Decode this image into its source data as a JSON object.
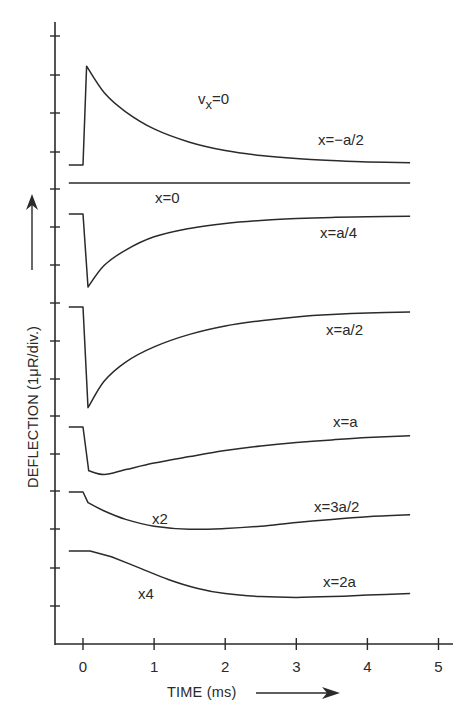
{
  "chart_data": {
    "type": "line",
    "title": "",
    "xlabel": "TIME (ms)",
    "ylabel": "DEFLECTION (1μR/div.)",
    "ylabel_unit_note": "1μR/div.",
    "xlim": [
      -0.4,
      5.3
    ],
    "xticks": [
      0,
      1,
      2,
      3,
      4,
      5
    ],
    "xtick_labels": [
      "0",
      "1",
      "2",
      "3",
      "4",
      "5"
    ],
    "y_tick_count": 16,
    "grid": false,
    "legend": "none (curves labeled inline)",
    "annotation": "v_x=0",
    "series": [
      {
        "name": "x=-a/2",
        "label": "x=−a/2",
        "scale_note": "",
        "baseline_div": 0,
        "points_ms_div": [
          [
            -0.2,
            0
          ],
          [
            0,
            0
          ],
          [
            0.05,
            2.6
          ],
          [
            0.3,
            1.9
          ],
          [
            0.6,
            1.4
          ],
          [
            1,
            0.95
          ],
          [
            1.5,
            0.6
          ],
          [
            2,
            0.38
          ],
          [
            2.5,
            0.25
          ],
          [
            3,
            0.17
          ],
          [
            3.5,
            0.12
          ],
          [
            4,
            0.08
          ],
          [
            4.6,
            0.06
          ]
        ]
      },
      {
        "name": "x=0",
        "label": "x=0",
        "scale_note": "",
        "baseline_div": 0,
        "points_ms_div": [
          [
            -0.2,
            0
          ],
          [
            4.6,
            0
          ]
        ]
      },
      {
        "name": "x=a/4",
        "label": "x=a/4",
        "scale_note": "",
        "baseline_div": 0,
        "points_ms_div": [
          [
            -0.2,
            0
          ],
          [
            0,
            0
          ],
          [
            0.07,
            -1.92
          ],
          [
            0.3,
            -1.35
          ],
          [
            0.6,
            -0.95
          ],
          [
            1,
            -0.6
          ],
          [
            1.5,
            -0.38
          ],
          [
            2,
            -0.25
          ],
          [
            2.5,
            -0.17
          ],
          [
            3,
            -0.12
          ],
          [
            3.5,
            -0.09
          ],
          [
            4,
            -0.07
          ],
          [
            4.6,
            -0.06
          ]
        ]
      },
      {
        "name": "x=a/2",
        "label": "x=a/2",
        "scale_note": "",
        "baseline_div": 0,
        "points_ms_div": [
          [
            -0.2,
            0
          ],
          [
            0,
            0
          ],
          [
            0.07,
            -2.65
          ],
          [
            0.3,
            -1.95
          ],
          [
            0.6,
            -1.45
          ],
          [
            1,
            -1.05
          ],
          [
            1.5,
            -0.72
          ],
          [
            2,
            -0.5
          ],
          [
            2.5,
            -0.36
          ],
          [
            3,
            -0.26
          ],
          [
            3.5,
            -0.2
          ],
          [
            4,
            -0.16
          ],
          [
            4.6,
            -0.13
          ]
        ]
      },
      {
        "name": "x=a",
        "label": "x=a",
        "scale_note": "",
        "baseline_div": 0,
        "points_ms_div": [
          [
            -0.2,
            0
          ],
          [
            0,
            0
          ],
          [
            0.08,
            -1.15
          ],
          [
            0.3,
            -1.25
          ],
          [
            0.6,
            -1.12
          ],
          [
            1,
            -0.95
          ],
          [
            1.5,
            -0.78
          ],
          [
            2,
            -0.62
          ],
          [
            2.5,
            -0.5
          ],
          [
            3,
            -0.41
          ],
          [
            3.5,
            -0.34
          ],
          [
            4,
            -0.28
          ],
          [
            4.6,
            -0.23
          ]
        ]
      },
      {
        "name": "x=3a/2",
        "label": "x=3a/2",
        "scale_note": "x2",
        "baseline_div": 0,
        "points_ms_div": [
          [
            -0.2,
            0
          ],
          [
            0,
            0
          ],
          [
            0.07,
            -0.28
          ],
          [
            0.3,
            -0.5
          ],
          [
            0.6,
            -0.72
          ],
          [
            1,
            -0.9
          ],
          [
            1.5,
            -0.98
          ],
          [
            2,
            -0.96
          ],
          [
            2.5,
            -0.9
          ],
          [
            3,
            -0.8
          ],
          [
            3.5,
            -0.72
          ],
          [
            4,
            -0.65
          ],
          [
            4.6,
            -0.6
          ]
        ]
      },
      {
        "name": "x=2a",
        "label": "x=2a",
        "scale_note": "x4",
        "baseline_div": 0,
        "points_ms_div": [
          [
            -0.2,
            0
          ],
          [
            0.1,
            0
          ],
          [
            0.4,
            -0.15
          ],
          [
            0.8,
            -0.45
          ],
          [
            1.2,
            -0.75
          ],
          [
            1.6,
            -0.98
          ],
          [
            2,
            -1.12
          ],
          [
            2.5,
            -1.2
          ],
          [
            3,
            -1.22
          ],
          [
            3.5,
            -1.2
          ],
          [
            4,
            -1.16
          ],
          [
            4.6,
            -1.12
          ]
        ]
      }
    ]
  },
  "layout_px": {
    "x0_px": 83,
    "px_per_ms": 71.1,
    "px_per_div": 38.0,
    "series_baselines_px": [
      165,
      183,
      214,
      307,
      427,
      492,
      551
    ],
    "y_ticks_px": [
      36,
      75,
      113,
      152,
      189,
      227,
      265,
      303,
      341,
      379,
      416,
      454,
      491,
      529,
      568,
      606
    ]
  },
  "labels": {
    "vx": "v",
    "vx_sub": "x",
    "vx_rest": "=0",
    "x_axis_title": "TIME (ms)",
    "y_axis_title": "DEFLECTION (1μR/div.)",
    "series_label_positions": [
      {
        "text": "x=−a/2",
        "x": 318,
        "y": 145
      },
      {
        "text": "x=0",
        "x": 155,
        "y": 203
      },
      {
        "text": "x=a/4",
        "x": 320,
        "y": 238
      },
      {
        "text": "x=a/2",
        "x": 326,
        "y": 335
      },
      {
        "text": "x=a",
        "x": 333,
        "y": 427
      },
      {
        "text": "x=3a/2",
        "x": 314,
        "y": 512
      },
      {
        "text": "x2",
        "x": 152,
        "y": 524
      },
      {
        "text": "x=2a",
        "x": 323,
        "y": 587
      },
      {
        "text": "x4",
        "x": 138,
        "y": 599
      }
    ]
  }
}
